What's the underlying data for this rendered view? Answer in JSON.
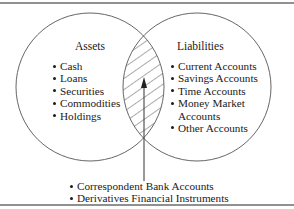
{
  "diagram": {
    "type": "venn",
    "colors": {
      "stroke": "#555555",
      "border": "#6b6b6b",
      "text": "#1a1a1a",
      "background": "#ffffff"
    },
    "left_set": {
      "title": "Assets",
      "items": [
        "Cash",
        "Loans",
        "Securities",
        "Commodities",
        "Holdings"
      ]
    },
    "right_set": {
      "title": "Liabilities",
      "items": [
        {
          "label": "Current Accounts"
        },
        {
          "label": "Savings Accounts"
        },
        {
          "label": "Time Accounts"
        },
        {
          "label": "Money Market",
          "continuation": "Accounts"
        },
        {
          "label": "Other Accounts"
        }
      ]
    },
    "intersection": {
      "pattern": "diagonal-hatch",
      "callout_items": [
        "Correspondent Bank Accounts",
        "Derivatives Financial Instruments"
      ]
    }
  }
}
